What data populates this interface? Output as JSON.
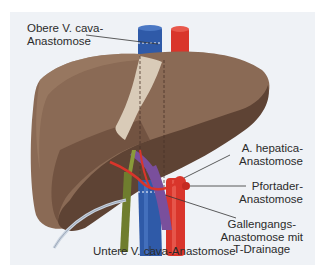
{
  "figure": {
    "type": "anatomical-illustration",
    "labels": {
      "upper_vc": [
        "Obere V. cava-",
        "Anastomose"
      ],
      "hepatic_artery": [
        "A. hepatica-",
        "Anastomose"
      ],
      "portal_vein": [
        "Pfortader-",
        "Anastomose"
      ],
      "bile_duct": [
        "Gallengangs-",
        "Anastomose mit",
        "T-Drainage"
      ],
      "lower_vc": "Untere V. cava-Anastomose"
    },
    "caption": "Abb. ... (cut off)"
  },
  "colors": {
    "panel_bg": "#eff2f6",
    "liver": "#8a6a55",
    "liver_dark": "#5e4334",
    "ligament": "#d9cbb8",
    "vena_cava": "#2f5aa8",
    "aorta": "#d9352b",
    "portal_vein": "#7a4f9c",
    "bile_duct": "#6f7d2e",
    "drain": "#c9d3df",
    "leader": "#333333"
  }
}
